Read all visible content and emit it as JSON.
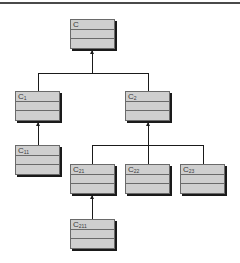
{
  "diagram": {
    "type": "class-hierarchy",
    "classes": [
      {
        "id": "C",
        "base": "C",
        "sub": ""
      },
      {
        "id": "C1",
        "base": "C",
        "sub": "1"
      },
      {
        "id": "C2",
        "base": "C",
        "sub": "2"
      },
      {
        "id": "C11",
        "base": "C",
        "sub": "11"
      },
      {
        "id": "C21",
        "base": "C",
        "sub": "21"
      },
      {
        "id": "C22",
        "base": "C",
        "sub": "22"
      },
      {
        "id": "C23",
        "base": "C",
        "sub": "23"
      },
      {
        "id": "C211",
        "base": "C",
        "sub": "211"
      }
    ],
    "edges": [
      {
        "from": "C1",
        "to": "C"
      },
      {
        "from": "C2",
        "to": "C"
      },
      {
        "from": "C11",
        "to": "C1"
      },
      {
        "from": "C21",
        "to": "C2"
      },
      {
        "from": "C22",
        "to": "C2"
      },
      {
        "from": "C23",
        "to": "C2"
      },
      {
        "from": "C211",
        "to": "C21"
      }
    ]
  }
}
